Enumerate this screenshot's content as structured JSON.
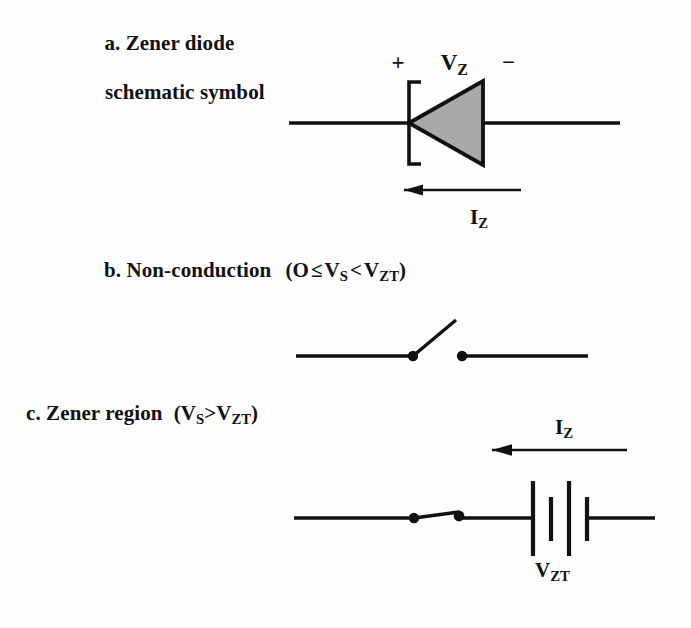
{
  "figure": {
    "background_color": "#fdfdfd",
    "ink_color": "#111111",
    "diode_fill_color": "#a9a9a9"
  },
  "part_a": {
    "caption_line1": "a. Zener diode",
    "caption_line2": "schematic symbol",
    "polarity_plus": "+",
    "polarity_minus": "−",
    "voltage_label_main": "V",
    "voltage_label_sub": "Z",
    "current_label_main": "I",
    "current_label_sub": "Z",
    "current_arrow_direction": "left"
  },
  "part_b": {
    "caption_prefix": "b. Non-conduction",
    "condition_open_paren": "(O",
    "condition_rel1": "≤",
    "condition_v1_main": "V",
    "condition_v1_sub": "S",
    "condition_rel2": "<",
    "condition_v2_main": "V",
    "condition_v2_sub": "ZT",
    "condition_close_paren": ")",
    "switch_state": "open"
  },
  "part_c": {
    "caption_prefix": "c. Zener region",
    "condition_open_paren": "(",
    "condition_v1_main": "V",
    "condition_v1_sub": "S",
    "condition_rel": ">",
    "condition_v2_main": "V",
    "condition_v2_sub": "ZT",
    "condition_close_paren": ")",
    "switch_state": "closed",
    "current_label_main": "I",
    "current_label_sub": "Z",
    "current_arrow_direction": "left",
    "battery_label_main": "V",
    "battery_label_sub": "ZT",
    "battery_cells": 2
  }
}
